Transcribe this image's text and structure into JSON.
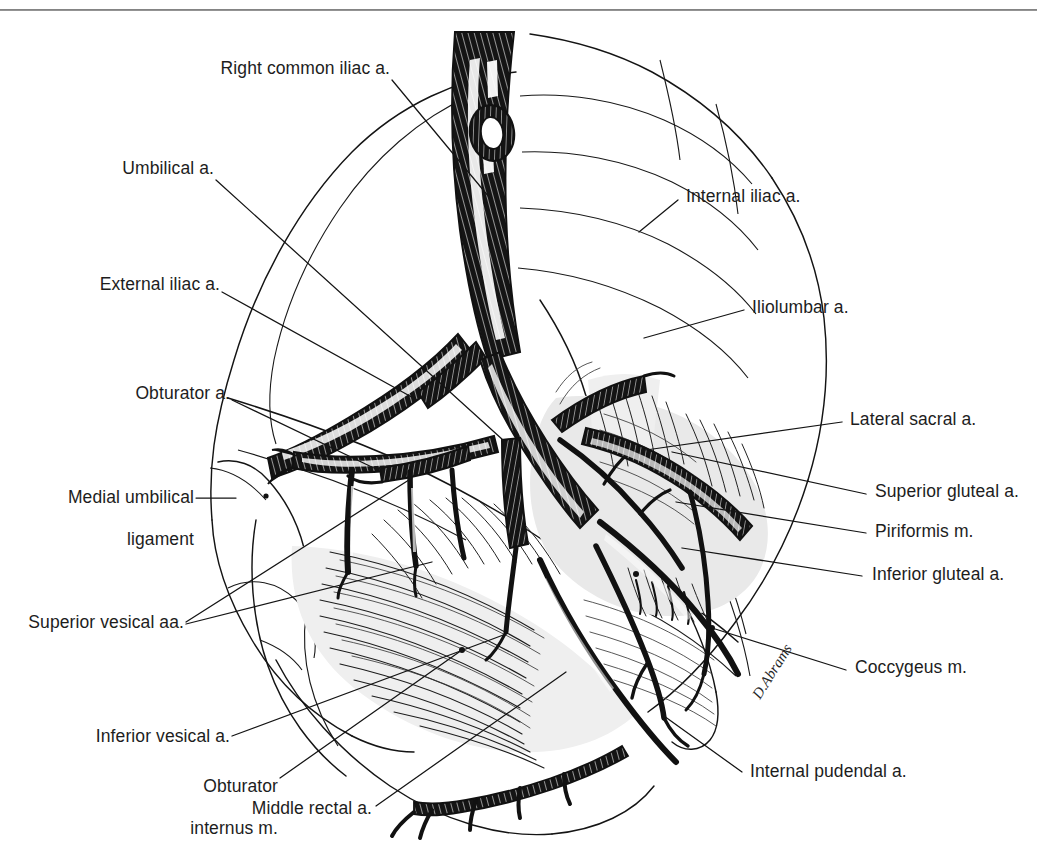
{
  "plate": {
    "title": "Arteries of the pelvis",
    "background_color": "#ffffff",
    "ink_color": "#111111",
    "shade_color": "#e9e9e9",
    "signature": "D.Abrams"
  },
  "labels_left": [
    {
      "id": "right-common-iliac-a",
      "text": "Right common iliac a."
    },
    {
      "id": "umbilical-a",
      "text": "Umbilical a."
    },
    {
      "id": "external-iliac-a",
      "text": "External iliac a."
    },
    {
      "id": "obturator-a",
      "text": "Obturator a."
    },
    {
      "id": "medial-umbilical-ligament-line1",
      "text": "Medial umbilical"
    },
    {
      "id": "medial-umbilical-ligament-line2",
      "text": "ligament"
    },
    {
      "id": "superior-vesical-aa",
      "text": "Superior vesical aa."
    },
    {
      "id": "inferior-vesical-a",
      "text": "Inferior vesical a."
    },
    {
      "id": "obturator-internus-m-line1",
      "text": "Obturator"
    },
    {
      "id": "obturator-internus-m-line2",
      "text": "internus m."
    },
    {
      "id": "middle-rectal-a",
      "text": "Middle rectal a."
    }
  ],
  "labels_right": [
    {
      "id": "internal-iliac-a",
      "text": "Internal iliac a."
    },
    {
      "id": "iliolumbar-a",
      "text": "Iliolumbar a."
    },
    {
      "id": "lateral-sacral-a",
      "text": "Lateral sacral a."
    },
    {
      "id": "superior-gluteal-a",
      "text": "Superior gluteal a."
    },
    {
      "id": "piriformis-m",
      "text": "Piriformis m."
    },
    {
      "id": "inferior-gluteal-a",
      "text": "Inferior gluteal a."
    },
    {
      "id": "coccygeus-m",
      "text": "Coccygeus m."
    },
    {
      "id": "internal-pudendal-a",
      "text": "Internal pudendal a."
    }
  ]
}
